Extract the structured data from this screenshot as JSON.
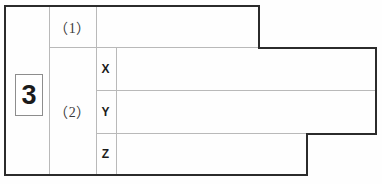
{
  "document": {
    "type": "answer-sheet-table",
    "question_number": "3",
    "ink_color": "#1b1b1b",
    "rule_color": "#b9b9b9",
    "frame_color": "#2b2b2b",
    "paper_color": "#fefefe"
  },
  "sub_questions": [
    {
      "id": "1",
      "label": "（1）"
    },
    {
      "id": "2",
      "label": "（2）"
    }
  ],
  "row_markers": [
    {
      "id": "x",
      "label": "X"
    },
    {
      "id": "y",
      "label": "Y"
    },
    {
      "id": "z",
      "label": "Z"
    }
  ],
  "answer_fields": {
    "q1": {
      "value": "",
      "placeholder": ""
    },
    "q2x": {
      "value": "",
      "placeholder": ""
    },
    "q2y": {
      "value": "",
      "placeholder": ""
    },
    "q2z": {
      "value": "",
      "placeholder": ""
    }
  }
}
